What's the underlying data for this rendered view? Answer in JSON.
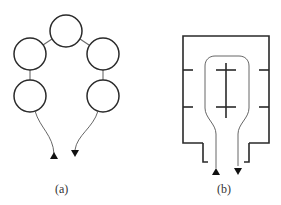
{
  "figure": {
    "panels": [
      {
        "id": "a",
        "caption": "(a)",
        "description": "Five circles connected in an arch with an inlet and outlet arrow",
        "node_count": 5,
        "arrows": [
          "up",
          "down"
        ]
      },
      {
        "id": "b",
        "caption": "(b)",
        "description": "Rectangular chamber with baffles and a U-shaped flow tube with inlet and outlet",
        "baffles_per_side": 2,
        "arrows": [
          "up",
          "down"
        ]
      }
    ]
  }
}
